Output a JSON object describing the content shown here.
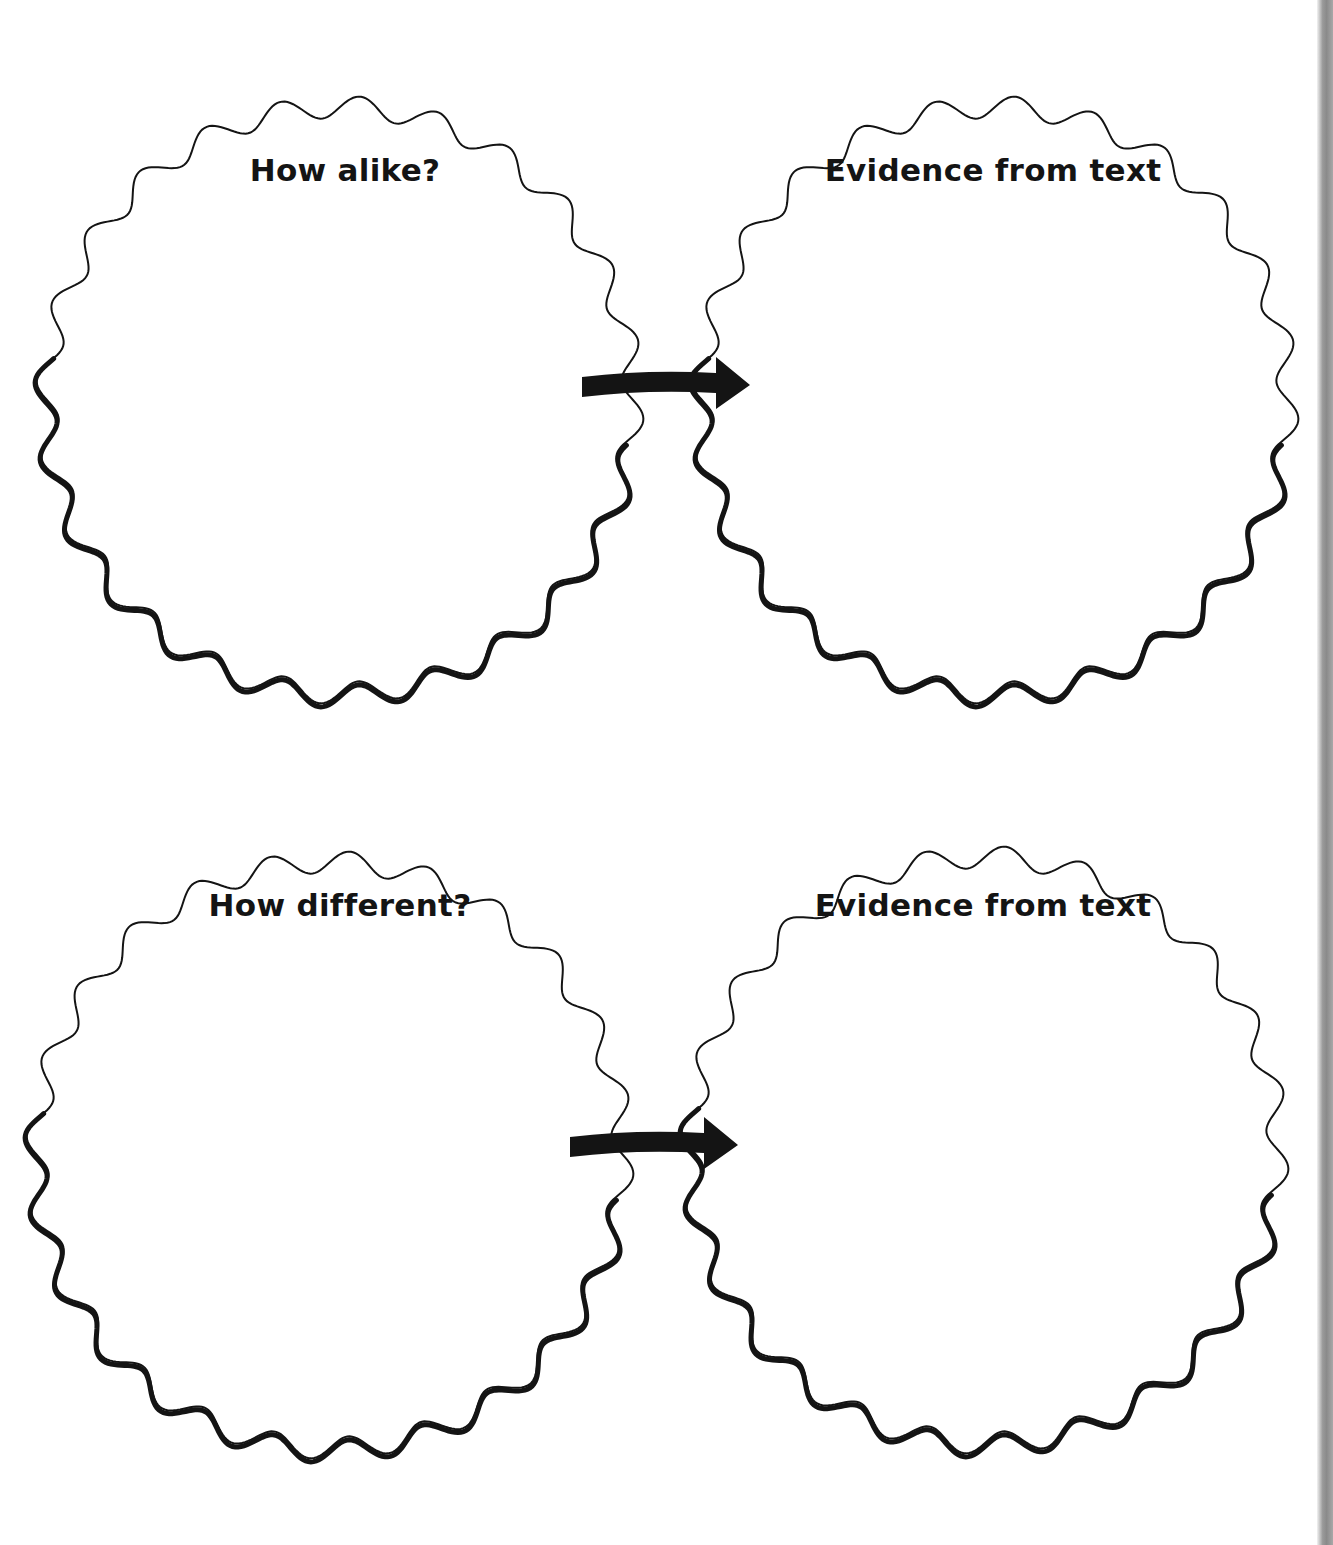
{
  "worksheet": {
    "panels": [
      {
        "id": "how-alike",
        "label": "How alike?",
        "cx": 340,
        "cy": 400,
        "r": 293,
        "label_x": 345,
        "label_y": 152
      },
      {
        "id": "evidence-alike",
        "label": "Evidence from text",
        "cx": 995,
        "cy": 400,
        "r": 293,
        "label_x": 993,
        "label_y": 152
      },
      {
        "id": "how-different",
        "label": "How different?",
        "cx": 330,
        "cy": 1155,
        "r": 293,
        "label_x": 340,
        "label_y": 887
      },
      {
        "id": "evidence-different",
        "label": "Evidence from text",
        "cx": 985,
        "cy": 1150,
        "r": 293,
        "label_x": 983,
        "label_y": 887
      }
    ],
    "arrows": [
      {
        "id": "arrow-alike",
        "x1": 582,
        "x2": 750,
        "y": 385
      },
      {
        "id": "arrow-different",
        "x1": 570,
        "x2": 738,
        "y": 1145
      }
    ],
    "colors": {
      "ink": "#141414",
      "paper": "#ffffff",
      "binding": "#8f8f8f"
    }
  }
}
